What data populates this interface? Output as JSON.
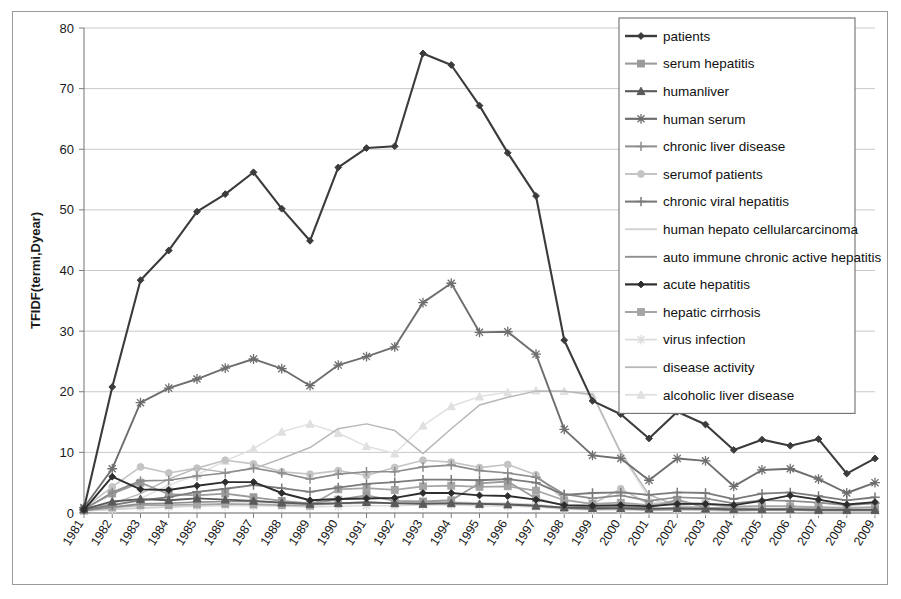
{
  "chart_data": {
    "type": "line",
    "title": "",
    "xlabel": "",
    "ylabel": "TFIDF(termi,Dyear)",
    "ylim": [
      0,
      80
    ],
    "yticks": [
      0,
      10,
      20,
      30,
      40,
      50,
      60,
      70,
      80
    ],
    "grid": true,
    "legend_position": "top-right",
    "categories": [
      "1981",
      "1982",
      "1983",
      "1984",
      "1985",
      "1986",
      "1987",
      "1988",
      "1989",
      "1990",
      "1991",
      "1992",
      "1993",
      "1994",
      "1995",
      "1996",
      "1997",
      "1998",
      "1999",
      "2000",
      "2001",
      "2002",
      "2003",
      "2004",
      "2005",
      "2006",
      "2007",
      "2008",
      "2009"
    ],
    "series": [
      {
        "name": "patients",
        "color": "#3b3b3b",
        "marker": "diamond",
        "width": 2.1,
        "values": [
          0.8,
          20.8,
          38.4,
          43.3,
          49.7,
          52.6,
          56.2,
          50.2,
          44.9,
          57.0,
          60.2,
          60.5,
          75.8,
          73.9,
          67.2,
          59.4,
          52.3,
          28.5,
          18.5,
          16.3,
          12.3,
          16.7,
          14.6,
          10.4,
          12.1,
          11.1,
          12.2,
          6.5,
          9.0
        ]
      },
      {
        "name": "serum hepatitis",
        "color": "#9b9b9b",
        "marker": "square",
        "width": 1.8,
        "values": [
          0.7,
          3.2,
          5.0,
          3.1,
          2.9,
          3.2,
          2.6,
          2.0,
          1.6,
          2.2,
          2.9,
          2.0,
          1.9,
          2.1,
          4.9,
          5.2,
          2.4,
          1.2,
          0.9,
          1.1,
          0.8,
          2.2,
          0.9,
          0.7,
          0.6,
          0.7,
          0.6,
          0.5,
          0.5
        ]
      },
      {
        "name": "humanliver",
        "color": "#5a5a5a",
        "marker": "triangle",
        "width": 1.8,
        "values": [
          0.6,
          1.9,
          2.3,
          2.1,
          2.4,
          2.2,
          2.0,
          1.7,
          1.5,
          1.6,
          1.8,
          1.6,
          1.5,
          1.6,
          1.5,
          1.4,
          1.2,
          0.9,
          0.8,
          0.8,
          0.7,
          0.8,
          0.7,
          0.6,
          0.6,
          0.6,
          0.5,
          0.5,
          0.5
        ]
      },
      {
        "name": "human serum",
        "color": "#6e6e6e",
        "marker": "asterisk",
        "width": 1.9,
        "values": [
          0.9,
          7.3,
          18.2,
          20.6,
          22.1,
          23.9,
          25.4,
          23.8,
          21.0,
          24.4,
          25.8,
          27.4,
          34.7,
          37.9,
          29.8,
          29.9,
          26.2,
          13.8,
          9.5,
          9.0,
          5.4,
          9.0,
          8.6,
          4.4,
          7.1,
          7.3,
          5.6,
          3.3,
          5.0
        ]
      },
      {
        "name": "chronic liver disease",
        "color": "#8d8d8d",
        "marker": "plus",
        "width": 1.7,
        "values": [
          0.6,
          3.4,
          5.3,
          5.4,
          6.1,
          6.6,
          7.4,
          6.6,
          5.6,
          6.4,
          6.8,
          6.8,
          7.6,
          7.9,
          7.0,
          6.6,
          5.9,
          3.1,
          2.4,
          2.9,
          2.0,
          2.6,
          2.4,
          1.6,
          2.1,
          2.0,
          1.7,
          1.3,
          1.6
        ]
      },
      {
        "name": "serumof patients",
        "color": "#c4c4c4",
        "marker": "circle",
        "width": 1.7,
        "values": [
          0.8,
          4.3,
          7.6,
          6.6,
          7.4,
          8.7,
          8.1,
          6.8,
          6.4,
          7.0,
          6.2,
          7.5,
          8.7,
          8.4,
          7.5,
          8.0,
          6.3,
          2.2,
          1.5,
          4.0,
          1.5,
          1.8,
          1.6,
          1.1,
          1.2,
          1.1,
          1.0,
          0.9,
          1.0
        ]
      },
      {
        "name": "chronic viral hepatitis",
        "color": "#7a7a7a",
        "marker": "plus",
        "width": 1.8,
        "values": [
          0.5,
          1.3,
          2.1,
          2.6,
          3.5,
          4.0,
          4.6,
          4.1,
          3.5,
          4.2,
          4.8,
          5.1,
          5.5,
          5.5,
          5.4,
          5.6,
          5.0,
          3.0,
          3.3,
          3.4,
          3.0,
          3.4,
          3.3,
          2.3,
          3.2,
          3.4,
          2.8,
          2.1,
          2.6
        ]
      },
      {
        "name": "human hepato cellularcarcinoma",
        "color": "#d2d2d2",
        "marker": "none",
        "width": 1.6,
        "values": [
          0.4,
          0.6,
          0.8,
          1.0,
          1.2,
          1.4,
          1.5,
          1.4,
          1.3,
          1.5,
          1.6,
          1.7,
          1.8,
          1.8,
          1.7,
          1.6,
          1.4,
          0.9,
          0.7,
          0.8,
          0.6,
          0.7,
          0.7,
          0.5,
          0.6,
          0.6,
          0.5,
          0.4,
          0.5
        ]
      },
      {
        "name": "auto immune chronic active hepatitis",
        "color": "#8f8f8f",
        "marker": "none",
        "width": 1.6,
        "values": [
          0.4,
          1.0,
          1.5,
          1.6,
          1.8,
          1.9,
          1.9,
          1.7,
          1.5,
          1.6,
          1.7,
          1.6,
          1.6,
          1.6,
          1.5,
          1.4,
          1.2,
          0.8,
          0.6,
          0.7,
          0.5,
          0.6,
          0.6,
          0.4,
          0.5,
          0.5,
          0.4,
          0.4,
          0.4
        ]
      },
      {
        "name": "acute hepatitis",
        "color": "#2e2e2e",
        "marker": "diamond",
        "width": 1.9,
        "values": [
          0.5,
          6.0,
          3.9,
          3.8,
          4.5,
          5.1,
          5.1,
          3.3,
          2.1,
          2.3,
          2.4,
          2.5,
          3.3,
          3.3,
          2.9,
          2.8,
          2.2,
          1.3,
          1.2,
          1.3,
          1.1,
          1.5,
          1.5,
          1.3,
          2.0,
          2.9,
          2.2,
          1.4,
          1.8
        ]
      },
      {
        "name": "hepatic cirrhosis",
        "color": "#a5a5a5",
        "marker": "square",
        "width": 1.7,
        "values": [
          0.4,
          0.9,
          1.3,
          1.3,
          1.4,
          1.5,
          1.4,
          1.3,
          1.2,
          3.9,
          4.1,
          3.8,
          4.4,
          4.5,
          4.3,
          4.4,
          3.7,
          2.1,
          1.5,
          1.7,
          1.3,
          1.5,
          1.4,
          1.0,
          1.1,
          1.1,
          0.9,
          0.8,
          0.9
        ]
      },
      {
        "name": "virus infection",
        "color": "#dcdcdc",
        "marker": "asterisk",
        "width": 1.5,
        "values": [
          0.3,
          0.6,
          0.9,
          1.0,
          1.1,
          1.2,
          1.2,
          1.1,
          1.0,
          1.1,
          1.2,
          1.2,
          1.3,
          1.3,
          1.2,
          1.1,
          1.0,
          0.6,
          0.5,
          0.5,
          0.4,
          0.5,
          0.4,
          0.3,
          0.4,
          0.4,
          0.3,
          0.3,
          0.3
        ]
      },
      {
        "name": "disease activity",
        "color": "#b8b8b8",
        "marker": "none",
        "width": 1.5,
        "values": [
          0.9,
          1.5,
          3.2,
          5.6,
          7.4,
          6.7,
          7.3,
          9.0,
          10.8,
          13.9,
          14.7,
          13.6,
          9.8,
          13.9,
          17.8,
          19.1,
          20.1,
          20.1,
          19.6,
          10.0,
          3.0,
          1.2,
          0.9,
          0.8,
          0.7,
          0.7,
          0.6,
          0.5,
          0.6
        ]
      },
      {
        "name": "alcoholic liver disease",
        "color": "#e0e0e0",
        "marker": "triangle",
        "width": 1.5,
        "values": [
          0.8,
          1.2,
          2.4,
          4.6,
          6.3,
          8.6,
          10.6,
          13.4,
          14.7,
          13.2,
          11.0,
          9.8,
          14.4,
          17.6,
          19.2,
          19.9,
          20.2,
          20.1,
          19.4,
          9.8,
          2.4,
          1.0,
          0.8,
          0.7,
          0.6,
          0.6,
          0.5,
          0.5,
          0.5
        ]
      }
    ]
  },
  "legend": {
    "items": [
      {
        "label": "patients"
      },
      {
        "label": "serum hepatitis"
      },
      {
        "label": "humanliver"
      },
      {
        "label": "human serum"
      },
      {
        "label": "chronic liver disease"
      },
      {
        "label": "serumof patients"
      },
      {
        "label": "chronic viral hepatitis"
      },
      {
        "label": "human hepato cellularcarcinoma"
      },
      {
        "label": "auto immune chronic active hepatitis"
      },
      {
        "label": "acute hepatitis"
      },
      {
        "label": "hepatic cirrhosis"
      },
      {
        "label": "virus infection"
      },
      {
        "label": "disease activity"
      },
      {
        "label": "alcoholic liver disease"
      }
    ]
  }
}
